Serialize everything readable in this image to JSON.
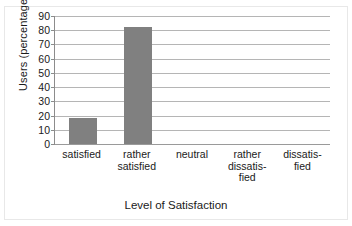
{
  "chart_data": {
    "type": "bar",
    "title": "",
    "xlabel": "Level of Satisfaction",
    "ylabel": "Users (percentage)",
    "categories": [
      "satisfied",
      "rather satisfied",
      "neutral",
      "rather dissatisfied",
      "dissatisfied"
    ],
    "category_label_lines": [
      [
        "satisfied"
      ],
      [
        "rather",
        "satisfied"
      ],
      [
        "neutral"
      ],
      [
        "rather",
        "dissatis-",
        "fied"
      ],
      [
        "dissatis-",
        "fied"
      ]
    ],
    "values": [
      18,
      82,
      0,
      0,
      0
    ],
    "ylim": [
      0,
      90
    ],
    "y_ticks": [
      0,
      10,
      20,
      30,
      40,
      50,
      60,
      70,
      80,
      90
    ],
    "y_tick_labels": [
      "0",
      "10",
      "20",
      "30",
      "40",
      "50",
      "60",
      "70",
      "80",
      "90"
    ],
    "grid": true,
    "legend": null,
    "bar_color": "#808080",
    "gridline_color": "#b5b5b5",
    "axis_color": "#8c8c8c",
    "background_color": "#ffffff"
  }
}
